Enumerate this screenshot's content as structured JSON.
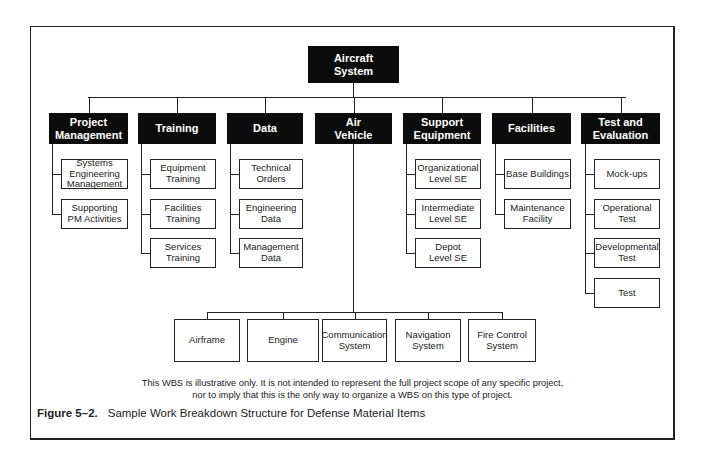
{
  "root": {
    "label": "Aircraft System",
    "lines": [
      "Aircraft",
      "System"
    ]
  },
  "level1": [
    {
      "id": "pm",
      "lines": [
        "Project",
        "Management"
      ],
      "children": [
        [
          "Systems",
          "Engineering",
          "Management"
        ],
        [
          "Supporting",
          "PM Activities"
        ]
      ]
    },
    {
      "id": "training",
      "lines": [
        "Training"
      ],
      "children": [
        [
          "Equipment",
          "Training"
        ],
        [
          "Facilities",
          "Training"
        ],
        [
          "Services",
          "Training"
        ]
      ]
    },
    {
      "id": "data",
      "lines": [
        "Data"
      ],
      "children": [
        [
          "Technical",
          "Orders"
        ],
        [
          "Engineering",
          "Data"
        ],
        [
          "Management",
          "Data"
        ]
      ]
    },
    {
      "id": "air-vehicle",
      "lines": [
        "Air",
        "Vehicle"
      ],
      "children": [
        [
          "Airframe"
        ],
        [
          "Engine"
        ],
        [
          "Communication",
          "System"
        ],
        [
          "Navigation",
          "System"
        ],
        [
          "Fire Control",
          "System"
        ]
      ]
    },
    {
      "id": "support-equipment",
      "lines": [
        "Support",
        "Equipment"
      ],
      "children": [
        [
          "Organizational",
          "Level SE"
        ],
        [
          "Intermediate",
          "Level SE"
        ],
        [
          "Depot",
          "Level SE"
        ]
      ]
    },
    {
      "id": "facilities",
      "lines": [
        "Facilities"
      ],
      "children": [
        [
          "Base Buildings"
        ],
        [
          "Maintenance",
          "Facility"
        ]
      ]
    },
    {
      "id": "test-evaluation",
      "lines": [
        "Test and",
        "Evaluation"
      ],
      "children": [
        [
          "Mock-ups"
        ],
        [
          "Operational",
          "Test"
        ],
        [
          "Developmental",
          "Test"
        ],
        [
          "Test"
        ]
      ]
    }
  ],
  "disclaimer": {
    "line1": "This WBS is illustrative only. It is not intended to represent the full project scope of any specific project,",
    "line2": "nor to imply that this is the only way to organize a WBS on this type of project."
  },
  "figure": {
    "number": "Figure 5–2.",
    "caption": "Sample Work Breakdown Structure for Defense Material Items"
  },
  "colors": {
    "node_fill": "#0c0c0c",
    "node_text": "#ffffff",
    "line": "#222222",
    "leaf_border": "#222222"
  }
}
